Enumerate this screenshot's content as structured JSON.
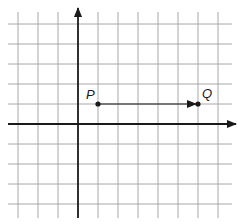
{
  "diagram": {
    "type": "coordinate-grid",
    "grid": {
      "spacing_px": 20,
      "vertical_lines_x": [
        18,
        38,
        58,
        98,
        118,
        138,
        158,
        178,
        198,
        218
      ],
      "horizontal_lines_y": [
        24,
        44,
        64,
        84,
        104,
        144,
        164,
        184,
        204
      ],
      "extent": {
        "x1": 8,
        "x2": 232,
        "y1": 12,
        "y2": 218
      },
      "color": "#a8a8a8"
    },
    "axes": {
      "origin_px": {
        "x": 78,
        "y": 124
      },
      "x_axis": {
        "from_x": 8,
        "to_x": 236,
        "arrow": "right"
      },
      "y_axis": {
        "from_y": 218,
        "to_y": 8,
        "arrow": "up"
      },
      "color": "#1a1a1a"
    },
    "points": [
      {
        "label": "P",
        "grid_x": 1,
        "grid_y": 1,
        "px": {
          "x": 98,
          "y": 104
        }
      },
      {
        "label": "Q",
        "grid_x": 6,
        "grid_y": 1,
        "px": {
          "x": 198,
          "y": 104
        }
      }
    ],
    "vector": {
      "from": "P",
      "to": "Q",
      "direction": "right",
      "length_units": 5
    }
  }
}
